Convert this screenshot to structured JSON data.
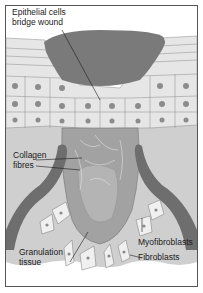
{
  "figure": {
    "labels": {
      "epithelial": "Epithelial cells\nbridge wound",
      "collagen": "Collagen\nfibres",
      "granulation": "Granulation\ntissue",
      "myofibroblasts": "Myofibroblasts",
      "fibroblasts": "Fibroblasts"
    },
    "colors": {
      "background": "#ffffff",
      "border": "#555555",
      "scab": "#7a7a7a",
      "epithelium": "#e4e4e4",
      "cell_outline": "#8a8a8a",
      "nucleus": "#8c8c8c",
      "dermis": "#cfcfcf",
      "granulation": "#a2a2a2",
      "vessel": "#6e6e6e"
    }
  }
}
